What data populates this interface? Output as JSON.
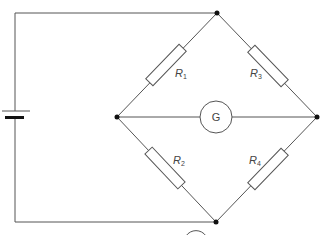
{
  "diagram": {
    "components": {
      "battery": {
        "type": "cell",
        "label": ""
      },
      "galvanometer": {
        "type": "meter",
        "label": "G"
      },
      "resistors": [
        {
          "id": "R1",
          "label_main": "R",
          "label_sub": "1",
          "position": "upper-left arm"
        },
        {
          "id": "R2",
          "label_main": "R",
          "label_sub": "2",
          "position": "lower-left arm"
        },
        {
          "id": "R3",
          "label_main": "R",
          "label_sub": "3",
          "position": "upper-right arm"
        },
        {
          "id": "R4",
          "label_main": "R",
          "label_sub": "4",
          "position": "lower-right arm"
        }
      ]
    },
    "nodes": [
      "top",
      "left",
      "right",
      "bottom"
    ],
    "colors": {
      "wire": "#555555",
      "node": "#111111",
      "label": "#444444",
      "background": "#ffffff"
    }
  }
}
